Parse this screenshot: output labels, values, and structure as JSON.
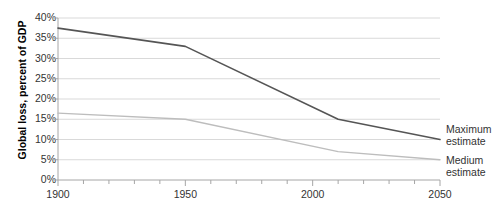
{
  "chart_data": {
    "type": "line",
    "title": "",
    "subtitle": "",
    "xlabel": "",
    "ylabel": "Global loss, percent of GDP",
    "xlim": [
      1900,
      2050
    ],
    "ylim": [
      0,
      40
    ],
    "grid": true,
    "grid_axis": "y",
    "legend_position": "right-inline",
    "x_ticks": [
      1900,
      1950,
      2000,
      2050
    ],
    "x_tick_labels": [
      "1900",
      "1950",
      "2000",
      "2050"
    ],
    "x_minor_tick_interval": 10,
    "y_ticks": [
      0,
      5,
      10,
      15,
      20,
      25,
      30,
      35,
      40
    ],
    "y_tick_labels": [
      "0%",
      "5%",
      "10%",
      "15%",
      "20%",
      "25%",
      "30%",
      "35%",
      "40%"
    ],
    "series": [
      {
        "name": "Maximum estimate",
        "label_line_1": "Maximum",
        "label_line_2": "estimate",
        "color": "#555555",
        "width": 1.6,
        "x": [
          1900,
          1950,
          2010,
          2050
        ],
        "values": [
          37.5,
          33.0,
          15.0,
          10.0
        ]
      },
      {
        "name": "Medium estimate",
        "label_line_1": "Medium",
        "label_line_2": "estimate",
        "color": "#bdbdbd",
        "width": 1.4,
        "x": [
          1900,
          1950,
          2010,
          2050
        ],
        "values": [
          16.5,
          15.0,
          7.0,
          5.0
        ]
      }
    ]
  },
  "axis": {
    "y_title": "Global loss, percent of GDP"
  },
  "legend": {
    "maximum": {
      "line1": "Maximum",
      "line2": "estimate"
    },
    "medium": {
      "line1": "Medium",
      "line2": "estimate"
    }
  },
  "colors": {
    "maximum_series": "#555555",
    "medium_series": "#bdbdbd",
    "gridline": "#d9d9d9",
    "axis": "#a6a6a6",
    "text": "#333333"
  }
}
